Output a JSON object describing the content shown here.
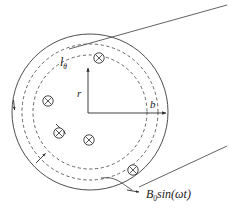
{
  "figure": {
    "background_color": "#ffffff",
    "line_color": "#3a3a3a",
    "ink_color": "#2b2b2b",
    "width": 229,
    "height": 211
  },
  "labels": {
    "loop_label": "l",
    "loop_subscript": "θ",
    "radius_label": "r",
    "outer_radius_label": "b",
    "field_label_main": "B",
    "field_label_sub": "0",
    "field_label_rest": "sin(ωt)",
    "field_label_full": "B₀sin(ωt)"
  },
  "geometry": {
    "center": {
      "x": 90,
      "y": 112
    },
    "outer_circle_radius": 78,
    "dashed_circle_outer_radius": 68,
    "dashed_circle_inner_radius": 57,
    "r_arrow_tip": {
      "x": 88,
      "y": 66
    },
    "b_arrow_tip": {
      "x": 168,
      "y": 113
    }
  },
  "field_markers": {
    "symbol": "cross-in-circle",
    "meaning": "magnetic field directed into the page",
    "radius": 5.2,
    "positions": [
      {
        "x": 99,
        "y": 58
      },
      {
        "x": 48,
        "y": 101
      },
      {
        "x": 59,
        "y": 133
      },
      {
        "x": 89,
        "y": 140
      },
      {
        "x": 133,
        "y": 170
      },
      {
        "x": 40,
        "y": 102
      }
    ]
  },
  "annotations": {
    "tangent_line_upper": "straight construction line from upper-left of circle to upper-right corner",
    "tangent_line_lower": "straight construction line from lower-right of circle to right edge",
    "leader_curve": "curved leader from circle boundary to field label",
    "loop_direction_arrow": "arrowhead on outer circle indicating circulation direction",
    "inward_arrows": "small arrows on dashed loop pointing toward center"
  }
}
